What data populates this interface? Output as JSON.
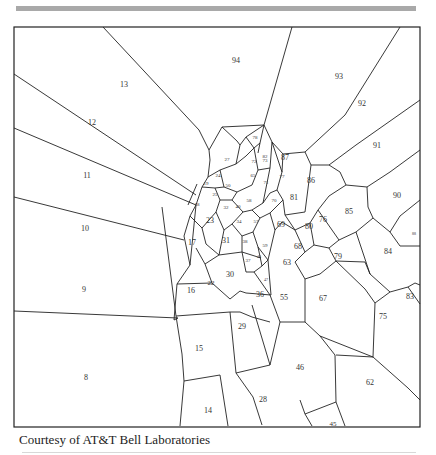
{
  "figure": {
    "type": "voronoi-diagram",
    "caption": "Courtesy of AT&T Bell Laboratories",
    "frame": {
      "x": 14,
      "y": 27,
      "width": 406,
      "height": 400
    },
    "line_color": "#222222",
    "rule_color": "#a9a9a9"
  },
  "cells": [
    {
      "id": "8",
      "label": "8",
      "x": 86,
      "y": 378,
      "size": 8
    },
    {
      "id": "9",
      "label": "9",
      "x": 84,
      "y": 290,
      "size": 8
    },
    {
      "id": "10",
      "label": "10",
      "x": 85,
      "y": 229,
      "size": 8
    },
    {
      "id": "11",
      "label": "11",
      "x": 87,
      "y": 176,
      "size": 8
    },
    {
      "id": "12",
      "label": "12",
      "x": 92,
      "y": 123,
      "size": 8
    },
    {
      "id": "13",
      "label": "13",
      "x": 124,
      "y": 85,
      "size": 8
    },
    {
      "id": "14",
      "label": "14",
      "x": 208,
      "y": 411,
      "size": 8
    },
    {
      "id": "15",
      "label": "15",
      "x": 199,
      "y": 349,
      "size": 8
    },
    {
      "id": "16",
      "label": "16",
      "x": 191,
      "y": 291,
      "size": 8
    },
    {
      "id": "17",
      "label": "17",
      "x": 192,
      "y": 243,
      "size": 8
    },
    {
      "id": "18",
      "label": "18",
      "x": 197,
      "y": 205,
      "size": 5
    },
    {
      "id": "19",
      "label": "19",
      "x": 206,
      "y": 184,
      "size": 5
    },
    {
      "id": "22",
      "label": "22",
      "x": 211,
      "y": 283,
      "size": 7
    },
    {
      "id": "23",
      "label": "23",
      "x": 210,
      "y": 221,
      "size": 8
    },
    {
      "id": "24",
      "label": "24",
      "x": 218,
      "y": 176,
      "size": 5
    },
    {
      "id": "25",
      "label": "25",
      "x": 215,
      "y": 195,
      "size": 5
    },
    {
      "id": "27",
      "label": "27",
      "x": 227,
      "y": 160,
      "size": 5
    },
    {
      "id": "28",
      "label": "28",
      "x": 263,
      "y": 400,
      "size": 8
    },
    {
      "id": "29",
      "label": "29",
      "x": 242,
      "y": 327,
      "size": 8
    },
    {
      "id": "30",
      "label": "30",
      "x": 230,
      "y": 275,
      "size": 8
    },
    {
      "id": "31",
      "label": "31",
      "x": 226,
      "y": 241,
      "size": 8
    },
    {
      "id": "32",
      "label": "32",
      "x": 226,
      "y": 208,
      "size": 5
    },
    {
      "id": "34",
      "label": "34",
      "x": 239,
      "y": 222,
      "size": 5
    },
    {
      "id": "36",
      "label": "36",
      "x": 260,
      "y": 295,
      "size": 8
    },
    {
      "id": "37",
      "label": "37",
      "x": 248,
      "y": 261,
      "size": 5
    },
    {
      "id": "38",
      "label": "38",
      "x": 245,
      "y": 242,
      "size": 5
    },
    {
      "id": "40",
      "label": "40",
      "x": 238,
      "y": 207,
      "size": 5
    },
    {
      "id": "45",
      "label": "45",
      "x": 333,
      "y": 424,
      "size": 7
    },
    {
      "id": "46",
      "label": "46",
      "x": 300,
      "y": 368,
      "size": 8
    },
    {
      "id": "47",
      "label": "47",
      "x": 266,
      "y": 280,
      "size": 4
    },
    {
      "id": "48",
      "label": "48",
      "x": 259,
      "y": 257,
      "size": 4
    },
    {
      "id": "50",
      "label": "50",
      "x": 228,
      "y": 186,
      "size": 5
    },
    {
      "id": "55",
      "label": "55",
      "x": 284,
      "y": 298,
      "size": 8
    },
    {
      "id": "57",
      "label": "57",
      "x": 256,
      "y": 222,
      "size": 5
    },
    {
      "id": "58",
      "label": "58",
      "x": 249,
      "y": 201,
      "size": 5
    },
    {
      "id": "59",
      "label": "59",
      "x": 265,
      "y": 246,
      "size": 5
    },
    {
      "id": "62",
      "label": "62",
      "x": 370,
      "y": 383,
      "size": 8
    },
    {
      "id": "63",
      "label": "63",
      "x": 287,
      "y": 263,
      "size": 8
    },
    {
      "id": "65",
      "label": "65",
      "x": 253,
      "y": 176,
      "size": 5
    },
    {
      "id": "67",
      "label": "67",
      "x": 323,
      "y": 299,
      "size": 8
    },
    {
      "id": "68",
      "label": "68",
      "x": 298,
      "y": 247,
      "size": 8
    },
    {
      "id": "69",
      "label": "69",
      "x": 281,
      "y": 225,
      "size": 8
    },
    {
      "id": "70",
      "label": "70",
      "x": 274,
      "y": 201,
      "size": 5
    },
    {
      "id": "71",
      "label": "71",
      "x": 266,
      "y": 183,
      "size": 5
    },
    {
      "id": "72",
      "label": "72",
      "x": 254,
      "y": 162,
      "size": 5
    },
    {
      "id": "73",
      "label": "73",
      "x": 265,
      "y": 161,
      "size": 5
    },
    {
      "id": "75",
      "label": "75",
      "x": 383,
      "y": 317,
      "size": 8
    },
    {
      "id": "76",
      "label": "76",
      "x": 323,
      "y": 220,
      "size": 8
    },
    {
      "id": "77",
      "label": "77",
      "x": 282,
      "y": 177,
      "size": 5
    },
    {
      "id": "78",
      "label": "78",
      "x": 255,
      "y": 138,
      "size": 5
    },
    {
      "id": "79",
      "label": "79",
      "x": 338,
      "y": 257,
      "size": 8
    },
    {
      "id": "80",
      "label": "80",
      "x": 309,
      "y": 227,
      "size": 8
    },
    {
      "id": "81",
      "label": "81",
      "x": 294,
      "y": 198,
      "size": 8
    },
    {
      "id": "82",
      "label": "82",
      "x": 265,
      "y": 157,
      "size": 5
    },
    {
      "id": "83",
      "label": "83",
      "x": 410,
      "y": 297,
      "size": 8
    },
    {
      "id": "84",
      "label": "84",
      "x": 388,
      "y": 252,
      "size": 8
    },
    {
      "id": "85",
      "label": "85",
      "x": 349,
      "y": 212,
      "size": 8
    },
    {
      "id": "86",
      "label": "86",
      "x": 311,
      "y": 181,
      "size": 8
    },
    {
      "id": "87",
      "label": "87",
      "x": 285,
      "y": 158,
      "size": 8
    },
    {
      "id": "88",
      "label": "88",
      "x": 414,
      "y": 234,
      "size": 4
    },
    {
      "id": "90",
      "label": "90",
      "x": 397,
      "y": 196,
      "size": 8
    },
    {
      "id": "91",
      "label": "91",
      "x": 377,
      "y": 146,
      "size": 8
    },
    {
      "id": "92",
      "label": "92",
      "x": 362,
      "y": 104,
      "size": 8
    },
    {
      "id": "93",
      "label": "93",
      "x": 339,
      "y": 77,
      "size": 8
    },
    {
      "id": "94",
      "label": "94",
      "x": 236,
      "y": 61,
      "size": 8
    }
  ],
  "edges": [
    [
      14,
      74,
      196,
      195
    ],
    [
      14,
      128,
      196,
      205
    ],
    [
      14,
      197,
      184,
      240
    ],
    [
      14,
      311,
      178,
      318
    ],
    [
      162,
      207,
      176,
      316
    ],
    [
      176,
      316,
      182,
      354
    ],
    [
      182,
      354,
      184,
      381
    ],
    [
      184,
      381,
      180,
      426
    ],
    [
      184,
      381,
      220,
      375
    ],
    [
      220,
      375,
      228,
      426
    ],
    [
      178,
      318,
      174,
      320
    ],
    [
      174,
      320,
      177,
      284
    ],
    [
      177,
      284,
      190,
      265
    ],
    [
      190,
      265,
      184,
      236
    ],
    [
      184,
      236,
      190,
      216
    ],
    [
      190,
      216,
      196,
      205
    ],
    [
      196,
      205,
      190,
      265
    ],
    [
      197,
      184,
      188,
      205
    ],
    [
      103,
      27,
      199,
      130
    ],
    [
      199,
      130,
      209,
      150
    ],
    [
      177,
      284,
      212,
      283
    ],
    [
      212,
      283,
      230,
      299
    ],
    [
      176,
      316,
      230,
      312
    ],
    [
      230,
      312,
      240,
      312
    ],
    [
      212,
      283,
      205,
      264
    ],
    [
      205,
      264,
      219,
      255
    ],
    [
      219,
      255,
      206,
      244
    ],
    [
      206,
      244,
      202,
      228
    ],
    [
      202,
      228,
      190,
      216
    ],
    [
      205,
      264,
      196,
      248
    ],
    [
      219,
      255,
      242,
      252
    ],
    [
      242,
      252,
      261,
      258
    ],
    [
      230,
      299,
      240,
      291
    ],
    [
      240,
      291,
      246,
      293
    ],
    [
      246,
      293,
      271,
      295
    ],
    [
      240,
      312,
      252,
      317
    ],
    [
      252,
      317,
      270,
      322
    ],
    [
      230,
      312,
      236,
      373
    ],
    [
      236,
      373,
      253,
      397
    ],
    [
      253,
      397,
      262,
      425
    ],
    [
      236,
      373,
      270,
      365
    ],
    [
      270,
      365,
      252,
      305
    ],
    [
      270,
      365,
      280,
      322
    ],
    [
      280,
      322,
      270,
      295
    ],
    [
      270,
      295,
      254,
      272
    ],
    [
      254,
      272,
      246,
      272
    ],
    [
      246,
      272,
      242,
      252
    ],
    [
      254,
      272,
      262,
      266
    ],
    [
      262,
      266,
      268,
      260
    ],
    [
      268,
      260,
      271,
      295
    ],
    [
      262,
      266,
      258,
      247
    ],
    [
      258,
      247,
      268,
      260
    ],
    [
      280,
      322,
      305,
      322
    ],
    [
      305,
      322,
      320,
      336
    ],
    [
      320,
      336,
      335,
      355
    ],
    [
      335,
      355,
      336,
      402
    ],
    [
      305,
      322,
      305,
      279
    ],
    [
      305,
      279,
      295,
      262
    ],
    [
      295,
      262,
      305,
      252
    ],
    [
      305,
      252,
      295,
      230
    ],
    [
      295,
      230,
      282,
      222
    ],
    [
      336,
      402,
      305,
      414
    ],
    [
      305,
      414,
      312,
      426
    ],
    [
      305,
      414,
      300,
      400
    ],
    [
      336,
      402,
      345,
      426
    ],
    [
      336,
      355,
      373,
      357
    ],
    [
      373,
      357,
      408,
      388
    ],
    [
      408,
      388,
      420,
      400
    ],
    [
      320,
      336,
      373,
      357
    ],
    [
      373,
      357,
      375,
      303
    ],
    [
      375,
      303,
      390,
      292
    ],
    [
      390,
      292,
      408,
      287
    ],
    [
      408,
      287,
      420,
      304
    ],
    [
      408,
      287,
      415,
      283
    ],
    [
      415,
      283,
      420,
      285
    ],
    [
      390,
      292,
      370,
      274
    ],
    [
      370,
      274,
      365,
      262
    ],
    [
      365,
      262,
      336,
      261
    ],
    [
      336,
      261,
      320,
      274
    ],
    [
      320,
      274,
      305,
      279
    ],
    [
      375,
      303,
      365,
      289
    ],
    [
      365,
      289,
      336,
      261
    ],
    [
      336,
      261,
      329,
      248
    ],
    [
      329,
      248,
      339,
      240
    ],
    [
      339,
      240,
      356,
      232
    ],
    [
      356,
      232,
      370,
      274
    ],
    [
      305,
      252,
      314,
      245
    ],
    [
      314,
      245,
      329,
      248
    ],
    [
      295,
      230,
      310,
      223
    ],
    [
      310,
      223,
      314,
      245
    ],
    [
      310,
      223,
      318,
      210
    ],
    [
      318,
      210,
      339,
      240
    ],
    [
      356,
      232,
      373,
      218
    ],
    [
      373,
      218,
      390,
      232
    ],
    [
      390,
      232,
      400,
      246
    ],
    [
      400,
      246,
      420,
      246
    ],
    [
      390,
      232,
      400,
      216
    ],
    [
      400,
      216,
      420,
      200
    ],
    [
      373,
      218,
      368,
      207
    ],
    [
      368,
      207,
      367,
      187
    ],
    [
      367,
      187,
      346,
      185
    ],
    [
      346,
      185,
      329,
      196
    ],
    [
      329,
      196,
      318,
      210
    ],
    [
      367,
      187,
      390,
      172
    ],
    [
      390,
      172,
      420,
      150
    ],
    [
      346,
      185,
      340,
      172
    ],
    [
      340,
      172,
      329,
      165
    ],
    [
      329,
      165,
      311,
      165
    ],
    [
      311,
      165,
      305,
      152
    ],
    [
      305,
      152,
      283,
      154
    ],
    [
      329,
      165,
      356,
      145
    ],
    [
      356,
      145,
      420,
      100
    ],
    [
      305,
      152,
      345,
      115
    ],
    [
      345,
      115,
      400,
      27
    ],
    [
      283,
      154,
      272,
      142
    ],
    [
      272,
      142,
      264,
      125
    ],
    [
      264,
      125,
      292,
      27
    ],
    [
      264,
      125,
      260,
      143
    ],
    [
      260,
      143,
      258,
      153
    ],
    [
      295,
      230,
      285,
      215
    ],
    [
      285,
      215,
      305,
      212
    ],
    [
      305,
      212,
      311,
      165
    ],
    [
      285,
      215,
      283,
      200
    ],
    [
      283,
      200,
      277,
      190
    ],
    [
      277,
      190,
      282,
      172
    ],
    [
      282,
      172,
      283,
      154
    ],
    [
      282,
      172,
      272,
      142
    ],
    [
      264,
      125,
      222,
      127
    ],
    [
      222,
      127,
      209,
      150
    ],
    [
      209,
      150,
      210,
      160
    ],
    [
      222,
      127,
      237,
      141
    ],
    [
      237,
      141,
      240,
      145
    ],
    [
      240,
      145,
      246,
      137
    ],
    [
      246,
      137,
      264,
      125
    ],
    [
      210,
      160,
      208,
      177
    ],
    [
      208,
      177,
      202,
      187
    ],
    [
      202,
      187,
      196,
      205
    ],
    [
      208,
      177,
      220,
      170
    ],
    [
      220,
      170,
      236,
      164
    ],
    [
      236,
      164,
      246,
      156
    ],
    [
      246,
      156,
      254,
      148
    ],
    [
      254,
      148,
      260,
      143
    ],
    [
      240,
      145,
      236,
      164
    ],
    [
      246,
      137,
      254,
      148
    ],
    [
      220,
      170,
      224,
      187
    ],
    [
      224,
      187,
      237,
      192
    ],
    [
      237,
      192,
      252,
      185
    ],
    [
      252,
      185,
      258,
      170
    ],
    [
      258,
      170,
      270,
      168
    ],
    [
      270,
      168,
      272,
      142
    ],
    [
      258,
      170,
      254,
      148
    ],
    [
      202,
      187,
      215,
      188
    ],
    [
      215,
      188,
      224,
      187
    ],
    [
      215,
      188,
      220,
      200
    ],
    [
      220,
      200,
      232,
      200
    ],
    [
      232,
      200,
      237,
      192
    ],
    [
      232,
      200,
      243,
      212
    ],
    [
      243,
      212,
      252,
      210
    ],
    [
      252,
      210,
      263,
      203
    ],
    [
      263,
      203,
      270,
      193
    ],
    [
      270,
      193,
      277,
      190
    ],
    [
      263,
      203,
      270,
      168
    ],
    [
      220,
      200,
      216,
      212
    ],
    [
      216,
      212,
      202,
      228
    ],
    [
      216,
      212,
      224,
      230
    ],
    [
      224,
      230,
      232,
      224
    ],
    [
      232,
      224,
      243,
      212
    ],
    [
      224,
      230,
      219,
      255
    ],
    [
      232,
      224,
      242,
      236
    ],
    [
      242,
      236,
      253,
      232
    ],
    [
      253,
      232,
      260,
      218
    ],
    [
      260,
      218,
      252,
      210
    ],
    [
      253,
      232,
      258,
      247
    ],
    [
      260,
      218,
      270,
      213
    ],
    [
      270,
      213,
      283,
      200
    ],
    [
      270,
      213,
      275,
      230
    ],
    [
      275,
      230,
      282,
      222
    ],
    [
      275,
      230,
      268,
      260
    ],
    [
      242,
      236,
      242,
      252
    ]
  ]
}
